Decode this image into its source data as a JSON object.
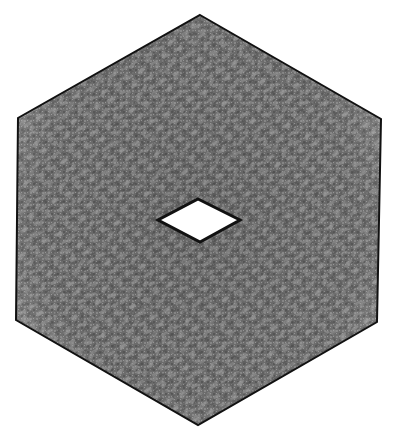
{
  "figure": {
    "background": "#ffffff",
    "outline_color": "#111111",
    "fill_dark": "#5f5f5f",
    "fill_mid": "#767676",
    "fill_light": "#9c9c9c",
    "hole_fill": "#ffffff",
    "outer_hexagon": {
      "points": "200,15 381,119 377,322 198,425 16,320 18,118"
    },
    "inner_diamond": {
      "points": "198,199 240,220 200,242 158,220"
    }
  }
}
